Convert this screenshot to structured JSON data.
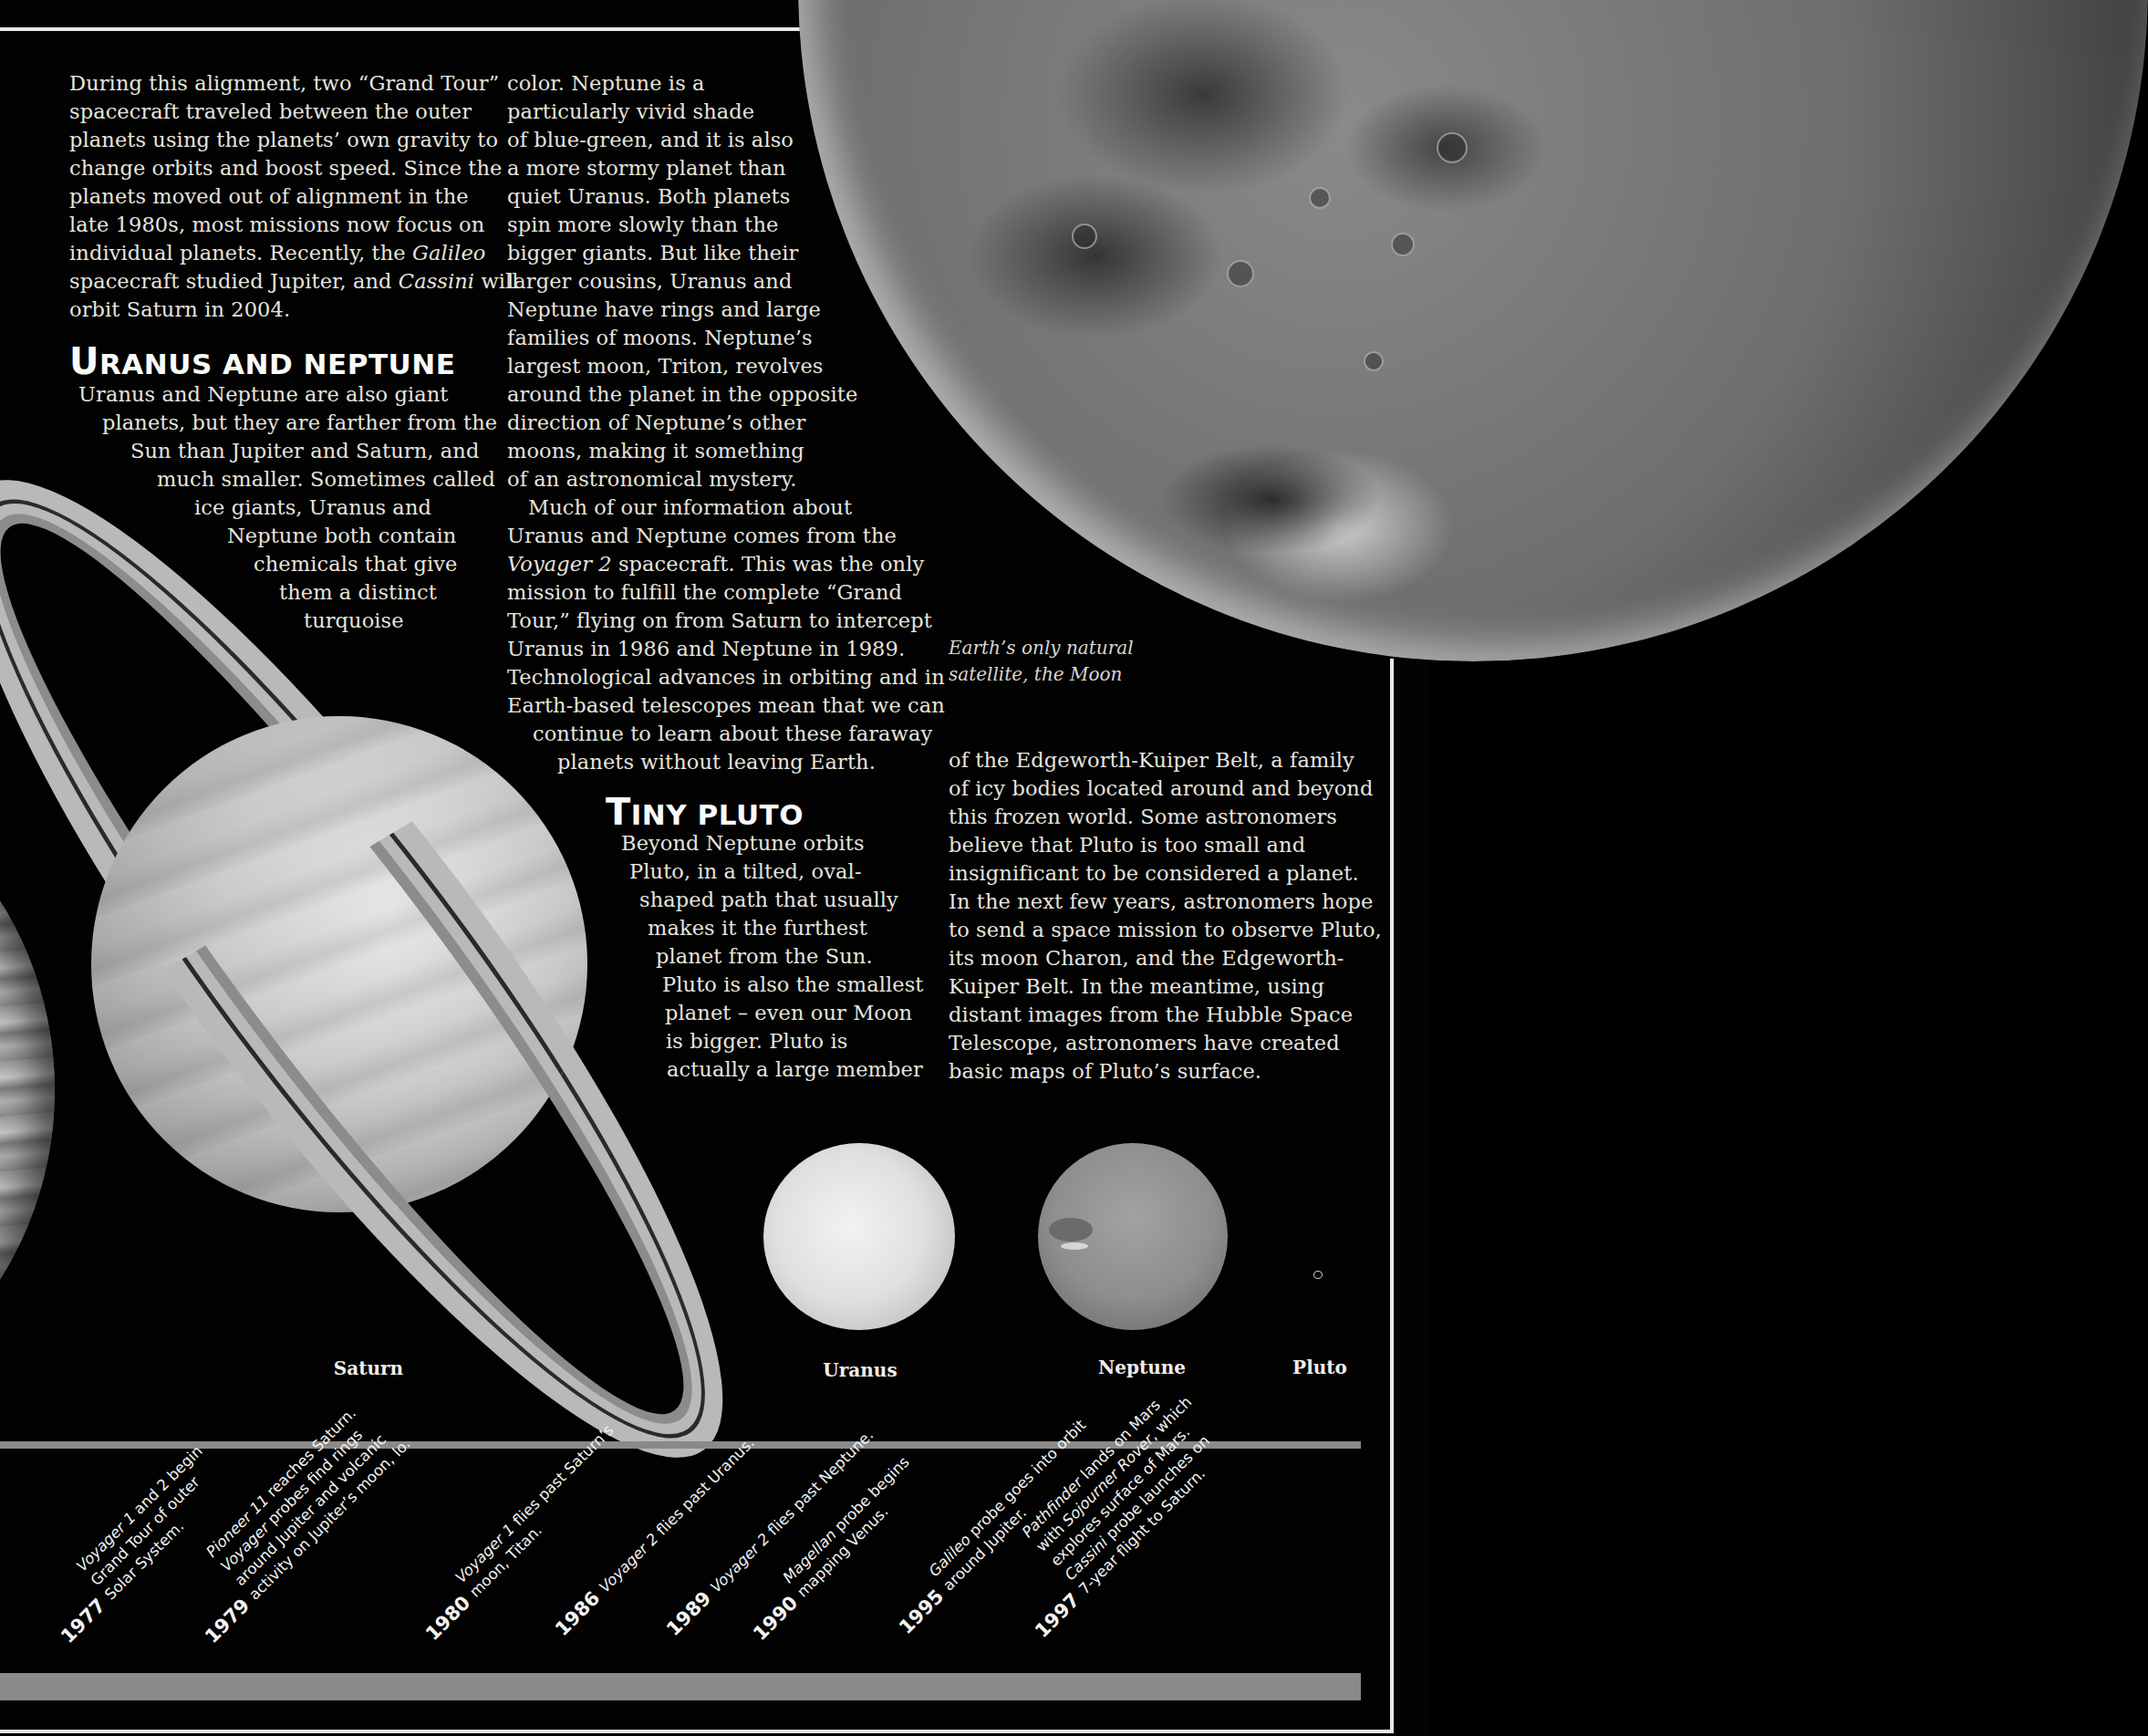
{
  "column1": {
    "para1_lines": [
      "During this alignment, two “Grand Tour”",
      "spacecraft traveled between the outer",
      "planets using the planets’ own gravity to",
      "change orbits and boost speed. Since the",
      "planets moved out of alignment in the",
      "late 1980s, most missions now focus on",
      "individual planets. Recently, the ",
      "spacecraft studied Jupiter, and ",
      "orbit Saturn in 2004."
    ],
    "galileo": "Galileo",
    "cassini": "Cassini",
    "cassini_after": " will",
    "heading_first": "U",
    "heading_rest": "RANUS AND NEPTUNE",
    "para2_lines": [
      "Uranus and Neptune are also giant",
      "planets, but they are farther from the",
      "Sun than Jupiter and Saturn, and",
      "much smaller. Sometimes called",
      "ice giants, Uranus and",
      "Neptune both contain",
      "chemicals that give",
      "them a distinct",
      "turquoise"
    ]
  },
  "column2": {
    "para1_lines": [
      "color. Neptune is a",
      "particularly vivid shade",
      "of blue-green, and it is also",
      "a more stormy planet than",
      "quiet Uranus. Both planets",
      "spin more slowly than the",
      "bigger giants. But like their",
      "larger cousins, Uranus and",
      "Neptune have rings and large",
      "families of moons. Neptune’s",
      "largest moon, Triton, revolves",
      "around the planet in the opposite",
      "direction of Neptune’s other",
      "moons, making it something",
      "of an astronomical mystery."
    ],
    "para2_first": "Much of our information about",
    "para2_line2": "Uranus and Neptune comes from the",
    "voyager2": "Voyager 2",
    "para2_line3_rest": " spacecraft. This was the only",
    "para2_lines_rest": [
      "mission to fulfill the complete “Grand",
      "Tour,” flying on from Saturn to intercept",
      "Uranus in 1986 and Neptune in 1989.",
      "Technological advances in orbiting and in",
      "Earth-based telescopes mean that we can",
      "continue to learn about these faraway",
      "planets without leaving Earth."
    ],
    "heading_first": "T",
    "heading_rest": "INY PLUTO",
    "pluto_lines": [
      "Beyond Neptune orbits",
      "Pluto, in a tilted, oval-",
      "shaped path that usually",
      "makes it the furthest",
      "planet from the Sun.",
      "Pluto is also the smallest",
      "planet – even our Moon",
      "is bigger. Pluto is",
      "actually a large member"
    ]
  },
  "column3": {
    "lines": [
      "of the Edgeworth-Kuiper Belt, a family",
      "of icy bodies located around and beyond",
      "this frozen world. Some astronomers",
      "believe that Pluto is too small and",
      "insignificant to be considered a planet.",
      "In the next few years, astronomers hope",
      "to send a space mission to observe Pluto,",
      "its moon Charon, and the Edgeworth-",
      "Kuiper Belt. In the meantime, using",
      "distant images from the Hubble Space",
      "Telescope, astronomers have created",
      "basic maps of Pluto’s surface."
    ]
  },
  "moon_caption": {
    "line1": "Earth’s only natural",
    "line2": "satellite, the Moon"
  },
  "planet_labels": {
    "saturn": "Saturn",
    "uranus": "Uranus",
    "neptune": "Neptune",
    "pluto": "Pluto"
  },
  "timeline": [
    {
      "year": "1977",
      "lines": [
        "Voyager 1 and 2 begin",
        "Grand Tour of outer",
        "Solar System."
      ],
      "italic_prefix": [
        "Voyager 1",
        "",
        ""
      ]
    },
    {
      "year": "1979",
      "lines": [
        "Pioneer 11 reaches Saturn.",
        "Voyager probes find rings",
        "around Jupiter and volcanic",
        "activity on Jupiter’s moon, Io."
      ],
      "italic_prefix": [
        "Pioneer 11",
        "Voyager",
        "",
        ""
      ]
    },
    {
      "year": "1980",
      "lines": [
        "Voyager 1 flies past Saturn’s",
        "moon, Titan."
      ],
      "italic_prefix": [
        "Voyager 1",
        ""
      ]
    },
    {
      "year": "1986",
      "lines": [
        "Voyager 2 flies past Uranus."
      ],
      "italic_prefix": [
        "Voyager 2"
      ]
    },
    {
      "year": "1989",
      "lines": [
        "Voyager 2 flies past Neptune."
      ],
      "italic_prefix": [
        "Voyager 2"
      ]
    },
    {
      "year": "1990",
      "lines": [
        "Magellan probe begins",
        "mapping Venus."
      ],
      "italic_prefix": [
        "Magellan",
        ""
      ]
    },
    {
      "year": "1995",
      "lines": [
        "Galileo probe goes into orbit",
        "around Jupiter."
      ],
      "italic_prefix": [
        "Galileo",
        ""
      ]
    },
    {
      "year": "1997",
      "lines": [
        "Pathfinder lands on Mars",
        "with Sojourner Rover, which",
        "explores surface of Mars.",
        "Cassini probe launches on",
        "7-year flight to Saturn."
      ],
      "italic_prefix": [
        "Pathfinder",
        "Sojourner Rover",
        "",
        "Cassini",
        ""
      ]
    }
  ],
  "colors": {
    "background": "#020202",
    "text": "#e6e4df",
    "frame": "#e9e9e9",
    "timeline_bar": "#8a8a8a"
  }
}
